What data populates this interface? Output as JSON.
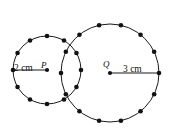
{
  "figure": {
    "background_color": "#ffffff",
    "stroke_color": "#1a1a1a",
    "dot_color": "#111111",
    "width": 173,
    "height": 132,
    "labels": {
      "left_radius": "2 cm",
      "left_center": "P",
      "right_center": "Q",
      "right_radius": "3 cm"
    },
    "circles": [
      {
        "name": "left-circle",
        "center_label": "P",
        "radius_label": "2 cm",
        "cx": 47,
        "cy": 70,
        "r": 34,
        "dot_count": 12,
        "dot_start_angle_deg": 0,
        "radius_line": {
          "x1": 47,
          "y1": 70,
          "x2": 13,
          "y2": 70
        }
      },
      {
        "name": "right-circle",
        "center_label": "Q",
        "radius_label": "3 cm",
        "cx": 110,
        "cy": 73,
        "r": 49,
        "dot_count": 14,
        "dot_start_angle_deg": 0,
        "radius_line": {
          "x1": 110,
          "y1": 73,
          "x2": 159,
          "y2": 73
        }
      }
    ]
  },
  "chart_data": {
    "type": "scatter",
    "xlabel": "",
    "ylabel": "",
    "xlim": [
      0,
      173
    ],
    "ylim": [
      0,
      132
    ],
    "grid": false,
    "legend": null,
    "annotations": [
      "2 cm",
      "P",
      "Q",
      "3 cm"
    ],
    "series": [
      {
        "name": "left-circle-points",
        "center": [
          47,
          70
        ],
        "radius": 34,
        "radius_cm": 2,
        "point_count": 12,
        "values": [
          [
            81,
            70
          ],
          [
            76.4,
            87,
            0
          ],
          [
            63.8,
            99.4
          ],
          [
            47,
            104
          ],
          [
            30.2,
            99.4
          ],
          [
            17.6,
            87
          ],
          [
            13,
            70
          ],
          [
            17.6,
            53
          ],
          [
            30.2,
            40.6
          ],
          [
            47,
            36
          ],
          [
            63.8,
            40.6
          ],
          [
            76.4,
            53
          ]
        ]
      },
      {
        "name": "right-circle-points",
        "center": [
          110,
          73
        ],
        "radius": 49,
        "radius_cm": 3,
        "point_count": 14,
        "values": [
          [
            159,
            73
          ],
          [
            154.2,
            94.5
          ],
          [
            140.8,
            111.2
          ],
          [
            121.9,
            120.5
          ],
          [
            101.0,
            120.5
          ],
          [
            82.1,
            111.2
          ],
          [
            68.8,
            94.5
          ],
          [
            61,
            73
          ],
          [
            68.8,
            51.5
          ],
          [
            82.1,
            34.8
          ],
          [
            101.0,
            25.5
          ],
          [
            121.9,
            25.5
          ],
          [
            140.8,
            34.8
          ],
          [
            154.2,
            51.5
          ]
        ]
      }
    ]
  }
}
